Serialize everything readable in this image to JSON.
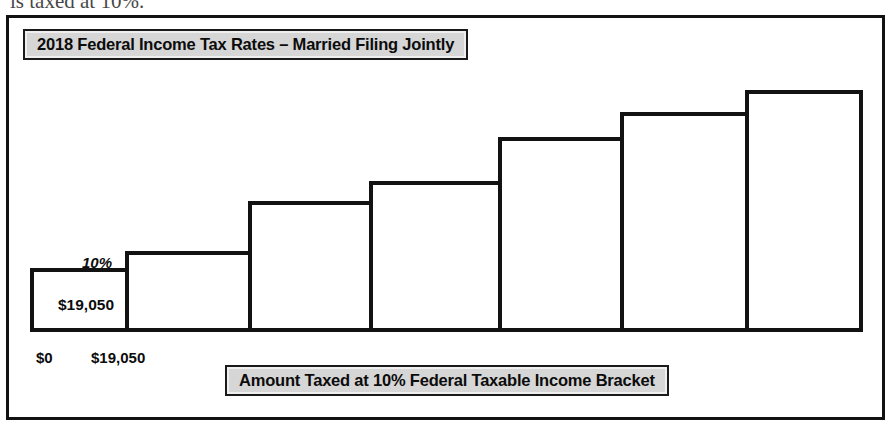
{
  "page": {
    "cut_off_line": "is taxed at 10%."
  },
  "figure": {
    "title": "2018 Federal Income Tax Rates – Married Filing Jointly",
    "caption": "Amount Taxed at 10% Federal Taxable Income Bracket",
    "frame_color": "#121212",
    "plaque_fill": "#d6d6d6",
    "bar_outline_color": "#121212",
    "bar_fill_color": "#ffffff"
  },
  "annotations": {
    "first_bar_value": "$19,050",
    "first_bracket_rate": "10%",
    "axis_start": "$0",
    "axis_first_threshold": "$19,050"
  },
  "chart_data": {
    "type": "bar",
    "title": "2018 Federal Income Tax Rates – Married Filing Jointly",
    "xlabel": "Amount Taxed at 10% Federal Taxable Income Bracket",
    "ylabel": "",
    "grid": false,
    "legend": null,
    "categories": [
      "1",
      "2",
      "3",
      "4",
      "5",
      "6",
      "7"
    ],
    "values": [
      60,
      77,
      127,
      147,
      191,
      216,
      238
    ],
    "ylim": [
      0,
      260
    ],
    "bar_edges_px": [
      29,
      124,
      247,
      368,
      497,
      619,
      744,
      858
    ],
    "baseline_px": 327,
    "bar_tops_px": [
      267,
      250,
      200,
      180,
      136,
      111,
      89
    ],
    "data_labels": {
      "1": "$19,050"
    },
    "rate_labels": {
      "1": "10%"
    },
    "x_tick_labels": [
      "$0",
      "$19,050"
    ]
  }
}
